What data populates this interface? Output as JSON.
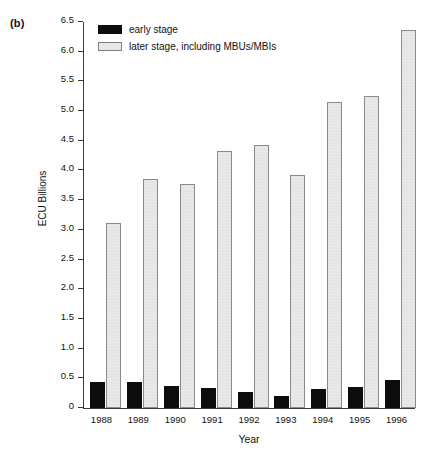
{
  "panel_label": "(b)",
  "chart_data": {
    "type": "bar",
    "title": "",
    "subtitle": "",
    "xlabel": "Year",
    "ylabel": "ECU Billions",
    "categories": [
      "1988",
      "1989",
      "1990",
      "1991",
      "1992",
      "1993",
      "1994",
      "1995",
      "1996"
    ],
    "series": [
      {
        "name": "early stage",
        "color": "#0d0d0d",
        "values": [
          0.44,
          0.44,
          0.37,
          0.33,
          0.27,
          0.21,
          0.32,
          0.35,
          0.47
        ]
      },
      {
        "name": "later stage, including MBUs/MBIs",
        "color": "#e9e9e9",
        "values": [
          3.12,
          3.85,
          3.78,
          4.32,
          4.43,
          3.92,
          5.15,
          5.25,
          6.37
        ]
      }
    ],
    "ylim": [
      0,
      6.5
    ],
    "ytick_values": [
      0,
      0.5,
      1.0,
      1.5,
      2.0,
      2.5,
      3.0,
      3.5,
      4.0,
      4.5,
      5.0,
      5.5,
      6.0,
      6.5
    ],
    "ytick_labels": [
      "0",
      "0.5",
      "1.0",
      "1.5",
      "2.0",
      "2.5",
      "3.0",
      "3.5",
      "4.0",
      "4.5",
      "5.0",
      "5.5",
      "6.0",
      "6.5"
    ],
    "grid": false,
    "legend_position": "top-left",
    "legend_entries": [
      "early stage",
      "later stage, including MBUs/MBIs"
    ]
  }
}
